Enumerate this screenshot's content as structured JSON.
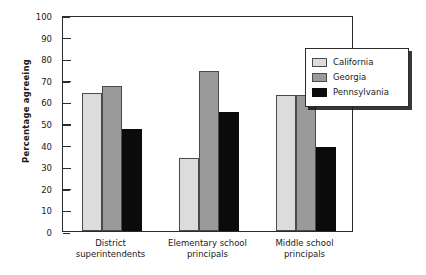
{
  "chart_data": {
    "type": "bar",
    "title": "",
    "xlabel": "",
    "ylabel": "Percentage agreeing",
    "ylim": [
      0,
      100
    ],
    "yticks": [
      0,
      10,
      20,
      30,
      40,
      50,
      60,
      70,
      80,
      90,
      100
    ],
    "grid": false,
    "legend_position": "upper right",
    "categories": [
      "District superintendents",
      "Elementary school principals",
      "Middle school principals"
    ],
    "category_lines": [
      [
        "District",
        "superintendents"
      ],
      [
        "Elementary school",
        "principals"
      ],
      [
        "Middle school",
        "principals"
      ]
    ],
    "series": [
      {
        "name": "California",
        "color": "#dcdcdc",
        "values": [
          64,
          34,
          63
        ]
      },
      {
        "name": "Georgia",
        "color": "#9a9a9a",
        "values": [
          67,
          74,
          63
        ]
      },
      {
        "name": "Pennsylvania",
        "color": "#0b0b0b",
        "values": [
          47,
          55,
          39
        ]
      }
    ]
  },
  "legend": {
    "entries": [
      {
        "label": "California"
      },
      {
        "label": "Georgia"
      },
      {
        "label": "Pennsylvania"
      }
    ]
  }
}
